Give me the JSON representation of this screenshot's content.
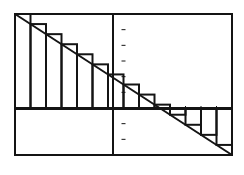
{
  "chart_data": {
    "type": "line",
    "title": "",
    "xlabel": "",
    "ylabel": "",
    "xlim": [
      -7,
      7
    ],
    "ylim": [
      -3,
      6
    ],
    "line": {
      "x": [
        -7,
        7
      ],
      "y": [
        6,
        -3
      ]
    },
    "rectangles": {
      "count": 14,
      "method": "left-endpoint",
      "x_left": [
        -7,
        -6,
        -5,
        -4,
        -3,
        -2,
        -1,
        0,
        1,
        2,
        3,
        4,
        5,
        6
      ],
      "heights": [
        6.0,
        5.357,
        4.714,
        4.071,
        3.429,
        2.786,
        2.143,
        1.5,
        0.857,
        0.214,
        -0.429,
        -1.071,
        -1.714,
        -2.357
      ]
    },
    "grid": false,
    "legend": null
  },
  "colors": {
    "ink": "#141414",
    "background": "#ffffff"
  }
}
